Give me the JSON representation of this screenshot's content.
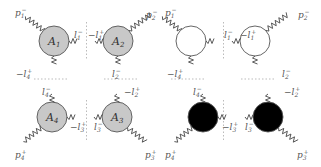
{
  "diagrams": [
    {
      "name": "labeled-quadruple-cut",
      "blobs": [
        {
          "id": "A1",
          "label": "A",
          "sub": "1",
          "cx": 54,
          "cy": 41,
          "r": 15,
          "fill": "#c8c8c8"
        },
        {
          "id": "A2",
          "label": "A",
          "sub": "2",
          "cx": 118,
          "cy": 41,
          "r": 15,
          "fill": "#c8c8c8"
        },
        {
          "id": "A4",
          "label": "A",
          "sub": "4",
          "cx": 52,
          "cy": 117,
          "r": 15,
          "fill": "#c8c8c8"
        },
        {
          "id": "A3",
          "label": "A",
          "sub": "3",
          "cx": 117,
          "cy": 117,
          "r": 15,
          "fill": "#c8c8c8"
        }
      ],
      "external_labels": [
        {
          "text": "p",
          "sub": "1",
          "sup": "−",
          "x": 15,
          "y": 16
        },
        {
          "text": "p",
          "sub": "2",
          "sup": "−",
          "x": 146,
          "y": 18
        },
        {
          "text": "p",
          "sub": "4",
          "sup": "+",
          "x": 15,
          "y": 158
        },
        {
          "text": "p",
          "sub": "3",
          "sup": "+",
          "x": 145,
          "y": 158
        }
      ],
      "internal_labels": [
        {
          "text": "l",
          "sub": "1",
          "sup": "−",
          "x": 74,
          "y": 38
        },
        {
          "text": "−l",
          "sub": "1",
          "sup": "+",
          "x": 88,
          "y": 38
        },
        {
          "text": "−l",
          "sub": "4",
          "sup": "+",
          "x": 16,
          "y": 77
        },
        {
          "text": "l",
          "sub": "2",
          "sup": "−",
          "x": 112,
          "y": 77
        },
        {
          "text": "l",
          "sub": "4",
          "sup": "−",
          "x": 42,
          "y": 95
        },
        {
          "text": "−l",
          "sub": "2",
          "sup": "+",
          "x": 124,
          "y": 95
        },
        {
          "text": "−l",
          "sub": "3",
          "sup": "+",
          "x": 70,
          "y": 130
        },
        {
          "text": "l",
          "sub": "3",
          "sup": "−",
          "x": 94,
          "y": 130
        }
      ]
    },
    {
      "name": "helicity-coloured-quadruple-cut",
      "blobs": [
        {
          "id": "W1",
          "label": "",
          "sub": "",
          "cx": 191,
          "cy": 41,
          "r": 15,
          "fill": "#ffffff"
        },
        {
          "id": "W2",
          "label": "",
          "sub": "",
          "cx": 255,
          "cy": 41,
          "r": 15,
          "fill": "#ffffff"
        },
        {
          "id": "B4",
          "label": "",
          "sub": "",
          "cx": 203,
          "cy": 117,
          "r": 15,
          "fill": "#000000"
        },
        {
          "id": "B3",
          "label": "",
          "sub": "",
          "cx": 268,
          "cy": 117,
          "r": 15,
          "fill": "#000000"
        }
      ],
      "external_labels": [
        {
          "text": "p",
          "sub": "1",
          "sup": "−",
          "x": 165,
          "y": 16
        },
        {
          "text": "p",
          "sub": "2",
          "sup": "−",
          "x": 298,
          "y": 18
        },
        {
          "text": "p",
          "sub": "4",
          "sup": "+",
          "x": 165,
          "y": 158
        },
        {
          "text": "p",
          "sub": "3",
          "sup": "+",
          "x": 297,
          "y": 158
        }
      ],
      "internal_labels": [
        {
          "text": "l",
          "sub": "1",
          "sup": "−",
          "x": 224,
          "y": 38
        },
        {
          "text": "−l",
          "sub": "1",
          "sup": "+",
          "x": 240,
          "y": 38
        },
        {
          "text": "−l",
          "sub": "4",
          "sup": "+",
          "x": 167,
          "y": 77
        },
        {
          "text": "l",
          "sub": "2",
          "sup": "−",
          "x": 282,
          "y": 77
        },
        {
          "text": "l",
          "sub": "4",
          "sup": "−",
          "x": 193,
          "y": 95
        },
        {
          "text": "−l",
          "sub": "2",
          "sup": "+",
          "x": 284,
          "y": 95
        },
        {
          "text": "−l",
          "sub": "3",
          "sup": "+",
          "x": 222,
          "y": 130
        },
        {
          "text": "l",
          "sub": "3",
          "sup": "−",
          "x": 245,
          "y": 130
        }
      ]
    }
  ],
  "colors": {
    "gluon": "#444444",
    "stroke": "#555555",
    "cut": "#bbbbbb",
    "gray_blob": "#c8c8c8",
    "black_blob": "#000000",
    "white_blob": "#ffffff"
  }
}
